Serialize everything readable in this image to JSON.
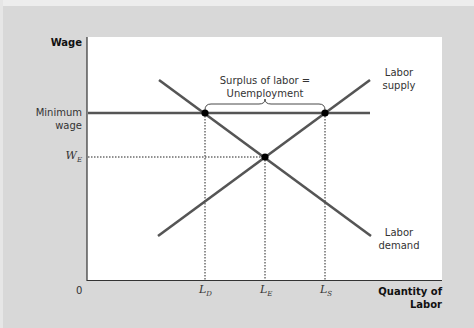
{
  "diagram": {
    "axes": {
      "y_label": "Wage",
      "x_label_line1": "Quantity of",
      "x_label_line2": "Labor",
      "origin": "0"
    },
    "y_ticks": {
      "min_wage_line1": "Minimum",
      "min_wage_line2": "wage",
      "we_main": "W",
      "we_sub": "E"
    },
    "x_ticks": {
      "ld_main": "L",
      "ld_sub": "D",
      "le_main": "L",
      "le_sub": "E",
      "ls_main": "L",
      "ls_sub": "S"
    },
    "curves": {
      "supply_line1": "Labor",
      "supply_line2": "supply",
      "demand_line1": "Labor",
      "demand_line2": "demand"
    },
    "annotation": {
      "line1": "Surplus of labor =",
      "line2": "Unemployment"
    },
    "colors": {
      "background": "#d8d8d8",
      "plot": "#ffffff",
      "curve": "#555555",
      "axis": "#333333",
      "point": "#000000"
    }
  }
}
